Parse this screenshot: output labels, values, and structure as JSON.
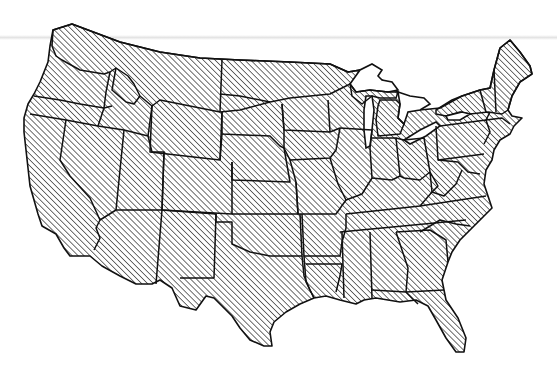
{
  "map": {
    "title": "Contiguous United States",
    "colors": {
      "outline": "#111111",
      "hatch": "#333333",
      "background": "#ffffff"
    },
    "pattern": "diagonal-hatch-45deg",
    "hatched_region": "southern and central states",
    "unhatched_region": [
      "Washington",
      "Northern Idaho",
      "Montana",
      "North Dakota",
      "Northern Minnesota",
      "Upper Michigan",
      "Northern New York",
      "Vermont",
      "New Hampshire",
      "Maine"
    ]
  }
}
